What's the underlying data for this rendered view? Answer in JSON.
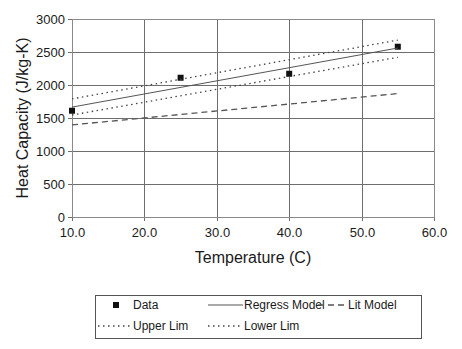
{
  "chart_data": {
    "type": "line",
    "title": "",
    "xlabel": "Temperature (C)",
    "ylabel": "Heat Capacity (J/kg-K)",
    "xlim": [
      10.0,
      60.0
    ],
    "ylim": [
      0,
      3000
    ],
    "x_ticks": [
      "10.0",
      "20.0",
      "30.0",
      "40.0",
      "50.0",
      "60.0"
    ],
    "y_ticks": [
      "0",
      "500",
      "1000",
      "1500",
      "2000",
      "2500",
      "3000"
    ],
    "grid": true,
    "legend_position": "bottom",
    "series": [
      {
        "name": "Data",
        "style": "markers",
        "marker": "square",
        "color": "#111111",
        "x": [
          10,
          25,
          40,
          55
        ],
        "y": [
          1610,
          2110,
          2170,
          2580
        ]
      },
      {
        "name": "Regress Model",
        "style": "solid",
        "color": "#555555",
        "x": [
          10,
          55
        ],
        "y": [
          1665,
          2560
        ]
      },
      {
        "name": "Lit Model",
        "style": "dashed",
        "color": "#555555",
        "x": [
          10,
          55
        ],
        "y": [
          1395,
          1870
        ]
      },
      {
        "name": "Upper Lim",
        "style": "dotted",
        "color": "#444444",
        "x": [
          10,
          55
        ],
        "y": [
          1790,
          2680
        ]
      },
      {
        "name": "Lower Lim",
        "style": "dotted",
        "color": "#444444",
        "x": [
          10,
          55
        ],
        "y": [
          1545,
          2420
        ]
      }
    ]
  },
  "legend": {
    "items": [
      {
        "label": "Data"
      },
      {
        "label": "Regress Model"
      },
      {
        "label": "Lit Model"
      },
      {
        "label": "Upper Lim"
      },
      {
        "label": "Lower Lim"
      }
    ]
  }
}
